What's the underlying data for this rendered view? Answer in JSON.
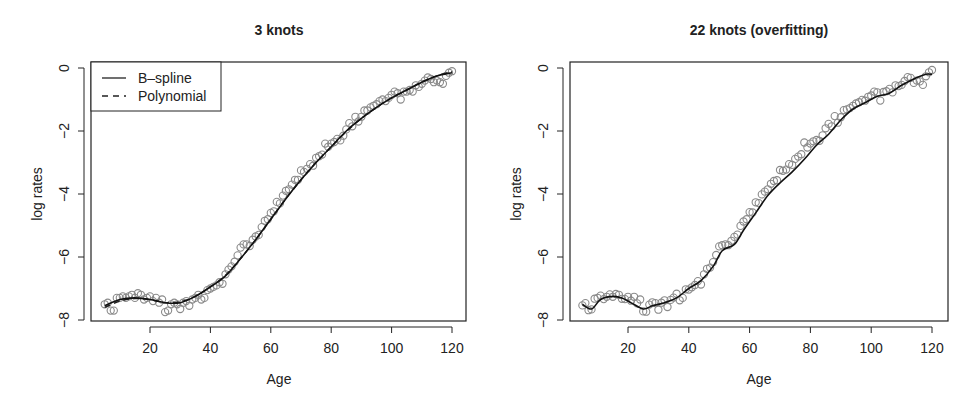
{
  "chart_data": [
    {
      "type": "scatter",
      "title": "3 knots",
      "xlabel": "Age",
      "ylabel": "log rates",
      "xlim": [
        2,
        124
      ],
      "ylim": [
        -8,
        0
      ],
      "xticks": [
        20,
        40,
        60,
        80,
        100,
        120
      ],
      "yticks": [
        0,
        -2,
        -4,
        -6,
        -8
      ],
      "grid": false,
      "legend": {
        "position": "top-left",
        "entries": [
          {
            "label": "B–spline",
            "linestyle": "solid"
          },
          {
            "label": "Polynomial",
            "linestyle": "dashed"
          }
        ]
      },
      "series": [
        {
          "name": "observed",
          "kind": "points",
          "marker": "open-circle",
          "color": "#8a8a8a"
        },
        {
          "name": "B–spline",
          "kind": "line",
          "linestyle": "solid",
          "color": "#111111",
          "x": [
            5,
            10,
            15,
            20,
            25,
            30,
            35,
            40,
            45,
            50,
            55,
            60,
            65,
            70,
            75,
            80,
            85,
            90,
            95,
            100,
            105,
            110,
            115,
            120
          ],
          "y": [
            -7.55,
            -7.35,
            -7.3,
            -7.35,
            -7.45,
            -7.45,
            -7.25,
            -6.95,
            -6.6,
            -6.05,
            -5.45,
            -4.8,
            -4.15,
            -3.55,
            -3.0,
            -2.5,
            -2.0,
            -1.6,
            -1.25,
            -0.95,
            -0.7,
            -0.45,
            -0.25,
            -0.15
          ]
        },
        {
          "name": "Polynomial",
          "kind": "line",
          "linestyle": "dashed",
          "color": "#333333",
          "x": [
            5,
            10,
            15,
            20,
            25,
            30,
            35,
            40,
            45,
            50,
            55,
            60,
            65,
            70,
            75,
            80,
            85,
            90,
            95,
            100,
            105,
            110,
            115,
            120
          ],
          "y": [
            -7.6,
            -7.4,
            -7.32,
            -7.35,
            -7.45,
            -7.42,
            -7.25,
            -6.95,
            -6.58,
            -6.05,
            -5.45,
            -4.8,
            -4.15,
            -3.55,
            -3.0,
            -2.5,
            -2.02,
            -1.6,
            -1.25,
            -0.95,
            -0.7,
            -0.45,
            -0.25,
            -0.12
          ]
        }
      ]
    },
    {
      "type": "scatter",
      "title": "22 knots (overfitting)",
      "xlabel": "Age",
      "ylabel": "log rates",
      "xlim": [
        2,
        124
      ],
      "ylim": [
        -8,
        0
      ],
      "xticks": [
        20,
        40,
        60,
        80,
        100,
        120
      ],
      "yticks": [
        0,
        -2,
        -4,
        -6,
        -8
      ],
      "grid": false,
      "series": [
        {
          "name": "observed",
          "kind": "points",
          "marker": "open-circle",
          "color": "#8a8a8a"
        },
        {
          "name": "B–spline (22 knots)",
          "kind": "line",
          "linestyle": "solid",
          "color": "#111111",
          "x": [
            5,
            8,
            11,
            15,
            18,
            21,
            25,
            28,
            32,
            36,
            40,
            44,
            48,
            51,
            55,
            58,
            62,
            66,
            70,
            74,
            78,
            82,
            86,
            90,
            94,
            98,
            102,
            106,
            110,
            114,
            118,
            120
          ],
          "y": [
            -7.5,
            -7.65,
            -7.35,
            -7.25,
            -7.3,
            -7.45,
            -7.65,
            -7.55,
            -7.45,
            -7.3,
            -7.0,
            -6.75,
            -6.3,
            -5.8,
            -5.6,
            -5.15,
            -4.6,
            -4.05,
            -3.65,
            -3.3,
            -2.9,
            -2.45,
            -2.1,
            -1.65,
            -1.3,
            -1.1,
            -0.9,
            -0.8,
            -0.55,
            -0.35,
            -0.2,
            -0.2
          ]
        }
      ]
    }
  ],
  "panels": [
    {
      "title": "3 knots",
      "xlabel": "Age",
      "ylabel": "log rates",
      "xtick_labels": [
        "20",
        "40",
        "60",
        "80",
        "100",
        "120"
      ],
      "ytick_labels": [
        "0",
        "−2",
        "−4",
        "−6",
        "−8"
      ],
      "legend": {
        "items": [
          "B–spline",
          "Polynomial"
        ]
      }
    },
    {
      "title": "22 knots (overfitting)",
      "xlabel": "Age",
      "ylabel": "log rates",
      "xtick_labels": [
        "20",
        "40",
        "60",
        "80",
        "100",
        "120"
      ],
      "ytick_labels": [
        "0",
        "−2",
        "−4",
        "−6",
        "−8"
      ]
    }
  ],
  "observations": {
    "x": [
      5,
      6,
      7,
      8,
      9,
      10,
      11,
      12,
      13,
      14,
      15,
      16,
      17,
      18,
      19,
      20,
      21,
      22,
      23,
      24,
      25,
      26,
      27,
      28,
      29,
      30,
      31,
      32,
      33,
      34,
      35,
      36,
      37,
      38,
      39,
      40,
      41,
      42,
      43,
      44,
      45,
      46,
      47,
      48,
      49,
      50,
      51,
      52,
      53,
      54,
      55,
      56,
      57,
      58,
      59,
      60,
      61,
      62,
      63,
      64,
      65,
      66,
      67,
      68,
      69,
      70,
      71,
      72,
      73,
      74,
      75,
      76,
      77,
      78,
      79,
      80,
      81,
      82,
      83,
      84,
      85,
      86,
      87,
      88,
      89,
      90,
      91,
      92,
      93,
      94,
      95,
      96,
      97,
      98,
      99,
      100,
      101,
      102,
      103,
      104,
      105,
      106,
      107,
      108,
      109,
      110,
      111,
      112,
      113,
      114,
      115,
      116,
      117,
      118,
      119,
      120
    ],
    "y": [
      -7.5,
      -7.45,
      -7.7,
      -7.7,
      -7.3,
      -7.3,
      -7.25,
      -7.3,
      -7.25,
      -7.2,
      -7.3,
      -7.15,
      -7.2,
      -7.35,
      -7.3,
      -7.25,
      -7.4,
      -7.3,
      -7.45,
      -7.35,
      -7.75,
      -7.7,
      -7.5,
      -7.45,
      -7.5,
      -7.65,
      -7.45,
      -7.4,
      -7.55,
      -7.35,
      -7.3,
      -7.2,
      -7.35,
      -7.3,
      -7.05,
      -7.0,
      -6.95,
      -6.9,
      -6.8,
      -6.85,
      -6.55,
      -6.4,
      -6.3,
      -6.15,
      -5.95,
      -5.7,
      -5.6,
      -5.6,
      -5.65,
      -5.45,
      -5.35,
      -5.3,
      -5.05,
      -4.85,
      -4.8,
      -4.6,
      -4.55,
      -4.25,
      -4.3,
      -4.05,
      -3.9,
      -3.85,
      -3.7,
      -3.55,
      -3.55,
      -3.25,
      -3.3,
      -3.2,
      -3.05,
      -3.1,
      -2.85,
      -2.8,
      -2.75,
      -2.4,
      -2.5,
      -2.4,
      -2.35,
      -2.25,
      -2.3,
      -2.15,
      -1.95,
      -1.75,
      -1.85,
      -1.55,
      -1.7,
      -1.55,
      -1.35,
      -1.35,
      -1.25,
      -1.2,
      -1.15,
      -1.05,
      -1.0,
      -1.05,
      -0.95,
      -0.85,
      -0.75,
      -0.8,
      -1.0,
      -0.75,
      -0.75,
      -0.7,
      -0.75,
      -0.55,
      -0.6,
      -0.5,
      -0.4,
      -0.3,
      -0.35,
      -0.45,
      -0.4,
      -0.45,
      -0.5,
      -0.25,
      -0.15,
      -0.1,
      -0.2,
      -0.3,
      -0.15,
      -0.2
    ]
  }
}
